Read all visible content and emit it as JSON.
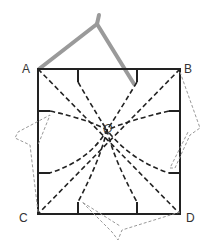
{
  "diagram": {
    "labels": {
      "A": "A",
      "B": "B",
      "C": "C",
      "D": "D",
      "O": "O"
    },
    "colors": {
      "line": "#222222",
      "compass": "#999999",
      "ghost": "#888888"
    }
  }
}
